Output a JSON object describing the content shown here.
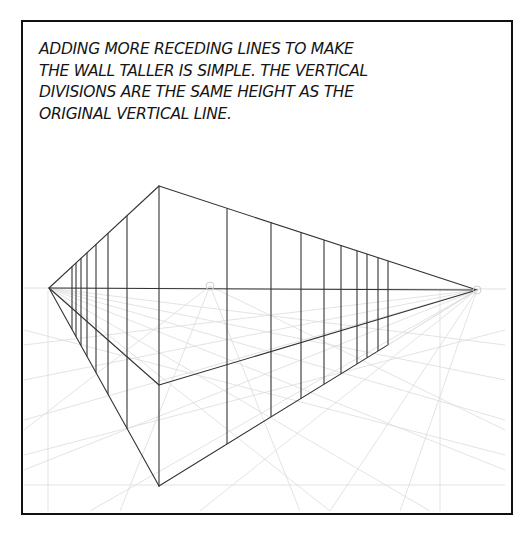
{
  "caption": {
    "lines": [
      "ADDING MORE RECEDING LINES TO MAKE",
      "THE WALL TALLER IS SIMPLE. THE VERTICAL",
      "DIVISIONS ARE THE SAME HEIGHT AS THE",
      "ORIGINAL VERTICAL LINE."
    ]
  },
  "diagram": {
    "type": "two-point perspective wall",
    "line_color": "#333333",
    "construction_color": "#d6d6d6",
    "horizon_y": 288,
    "vanishing_points": {
      "left": {
        "x": 49,
        "y": 288
      },
      "right": {
        "x": 477,
        "y": 290
      }
    },
    "center_mark": {
      "x": 210,
      "y": 286
    },
    "near_vertical": {
      "x": 159,
      "top_y": 186,
      "middle_y": 385,
      "bottom_y": 486
    },
    "left_wall_verticals_x": [
      72,
      76,
      81,
      87,
      96,
      108,
      127
    ],
    "right_wall_verticals_x": [
      227,
      271,
      301,
      324,
      341,
      357,
      367,
      378,
      388
    ]
  }
}
